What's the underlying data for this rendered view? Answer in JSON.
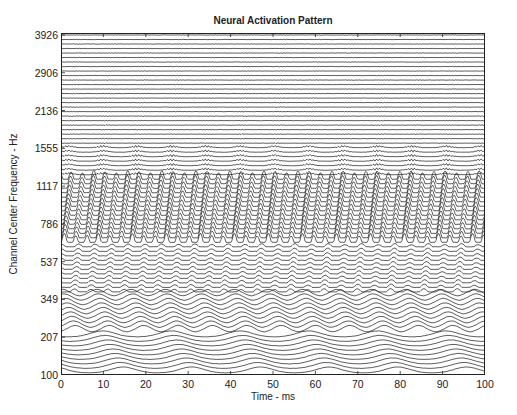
{
  "chart_data": {
    "type": "line",
    "subtype": "stacked-waveform (auditory nerve / cochleagram neurogram)",
    "title": "Neural Activation Pattern",
    "xlabel": "Time - ms",
    "ylabel": "Channel Center Frequency - Hz",
    "xlim": [
      0,
      100
    ],
    "x_ticks": [
      0,
      10,
      20,
      30,
      40,
      50,
      60,
      70,
      80,
      90,
      100
    ],
    "y_tick_labels": [
      "3926",
      "2906",
      "2136",
      "1555",
      "1117",
      "786",
      "537",
      "349",
      "207",
      "100"
    ],
    "y_tick_values_hz": [
      3926,
      2906,
      2136,
      1555,
      1117,
      786,
      537,
      349,
      207,
      100
    ],
    "channel_count": 76,
    "grid": false,
    "legend": null,
    "features": [
      {
        "region_hz": [
          100,
          350
        ],
        "description": "low-frequency channels with broad, slanted traveling-wave peaks roughly every ~8 ms"
      },
      {
        "region_hz": [
          350,
          650
        ],
        "description": "periodic ripples, moderate amplitude"
      },
      {
        "region_hz": [
          700,
          1300
        ],
        "description": "dense, high-amplitude periodic activation (formant region), darkest band"
      },
      {
        "region_hz": [
          1300,
          1700
        ],
        "description": "smaller periodic bursts at ~8 ms spacing"
      },
      {
        "region_hz": [
          1700,
          3926
        ],
        "description": "low-amplitude, near-flat traces with faint bursts"
      }
    ]
  },
  "colors": {
    "trace": "#1a1a1a",
    "axes": "#222222",
    "background": "#ffffff"
  }
}
